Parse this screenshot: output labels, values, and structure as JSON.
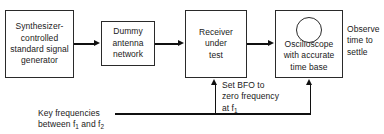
{
  "diagram": {
    "blocks": [
      {
        "id": "synthesizer",
        "name": "synthesizer-controlled-standard-signal-generator",
        "lines": [
          "Synthesizer-",
          "controlled",
          "standard signal",
          "generator"
        ]
      },
      {
        "id": "dummy",
        "name": "dummy-antenna-network",
        "lines": [
          "Dummy",
          "antenna",
          "network"
        ]
      },
      {
        "id": "receiver",
        "name": "receiver-under-test",
        "lines": [
          "Receiver",
          "under",
          "test"
        ]
      },
      {
        "id": "scope",
        "name": "oscilloscope-with-accurate-time-base",
        "lines": [
          "Oscilloscope",
          "with accurate",
          "time base"
        ]
      }
    ],
    "annotations": {
      "observe": [
        "Observe",
        "time to",
        "settle"
      ],
      "bfo": [
        "Set BFO to",
        "zero frequency",
        "at f"
      ],
      "bfo_subscript": "1",
      "key_line1": "Key frequencies",
      "key_line2_pre": "between f",
      "key_sub1": "1",
      "key_line2_mid": " and f",
      "key_sub2": "2"
    }
  }
}
